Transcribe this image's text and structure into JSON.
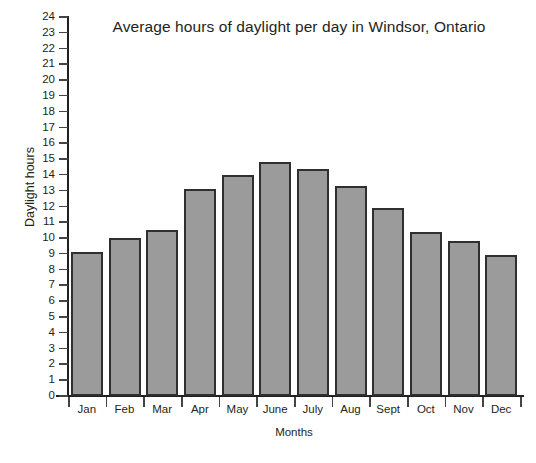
{
  "chart_data": {
    "type": "bar",
    "title": "Average hours of daylight per day in Windsor, Ontario",
    "xlabel": "Months",
    "ylabel": "Daylight hours",
    "categories": [
      "Jan",
      "Feb",
      "Mar",
      "Apr",
      "May",
      "June",
      "July",
      "Aug",
      "Sept",
      "Oct",
      "Nov",
      "Dec"
    ],
    "values": [
      9.1,
      10.0,
      10.5,
      13.1,
      14.0,
      14.8,
      14.4,
      13.3,
      11.9,
      10.4,
      9.8,
      8.9
    ],
    "ylim": [
      0,
      24
    ],
    "ytick_step": 1,
    "yticks": [
      0,
      1,
      2,
      3,
      4,
      5,
      6,
      7,
      8,
      9,
      10,
      11,
      12,
      13,
      14,
      15,
      16,
      17,
      18,
      19,
      20,
      21,
      22,
      23,
      24
    ],
    "grid": false,
    "legend": null,
    "bar_color": "#9b9b9b",
    "bar_edge_color": "#2f2f2f",
    "axis_color": "#231f20",
    "background": "#ffffff"
  }
}
